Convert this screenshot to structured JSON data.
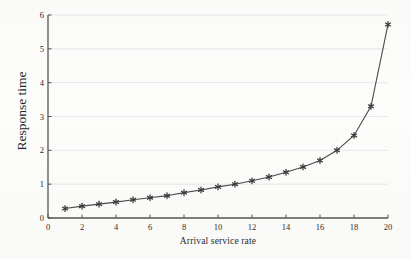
{
  "figure": {
    "background_color": "#fdfdfc",
    "ink_color": "#3a3a3a",
    "grid_color": "#e2e2e6",
    "axis_color": "#555555",
    "caption_fragment": ""
  },
  "chart_data": {
    "type": "line",
    "title": "",
    "xlabel": "Arrival service rate",
    "ylabel": "Response time",
    "xlim": [
      0,
      20
    ],
    "ylim": [
      0,
      6
    ],
    "grid": true,
    "grid_axis": "y",
    "legend": null,
    "marker": "star",
    "line_color": "#4a4a4a",
    "marker_color": "#3b3b3b",
    "xticks": [
      0,
      2,
      4,
      6,
      8,
      10,
      12,
      14,
      16,
      18,
      20
    ],
    "yticks": [
      0,
      1,
      2,
      3,
      4,
      5,
      6
    ],
    "x": [
      1,
      2,
      3,
      4,
      5,
      6,
      7,
      8,
      9,
      10,
      11,
      12,
      13,
      14,
      15,
      16,
      17,
      18,
      19,
      20
    ],
    "values": [
      0.28,
      0.35,
      0.41,
      0.47,
      0.54,
      0.6,
      0.66,
      0.75,
      0.83,
      0.92,
      1.0,
      1.1,
      1.21,
      1.35,
      1.51,
      1.7,
      2.0,
      2.44,
      3.3,
      5.72
    ],
    "series": [
      {
        "name": "Response time",
        "values": [
          0.28,
          0.35,
          0.41,
          0.47,
          0.54,
          0.6,
          0.66,
          0.75,
          0.83,
          0.92,
          1.0,
          1.1,
          1.21,
          1.35,
          1.51,
          1.7,
          2.0,
          2.44,
          3.3,
          5.72
        ]
      }
    ]
  }
}
